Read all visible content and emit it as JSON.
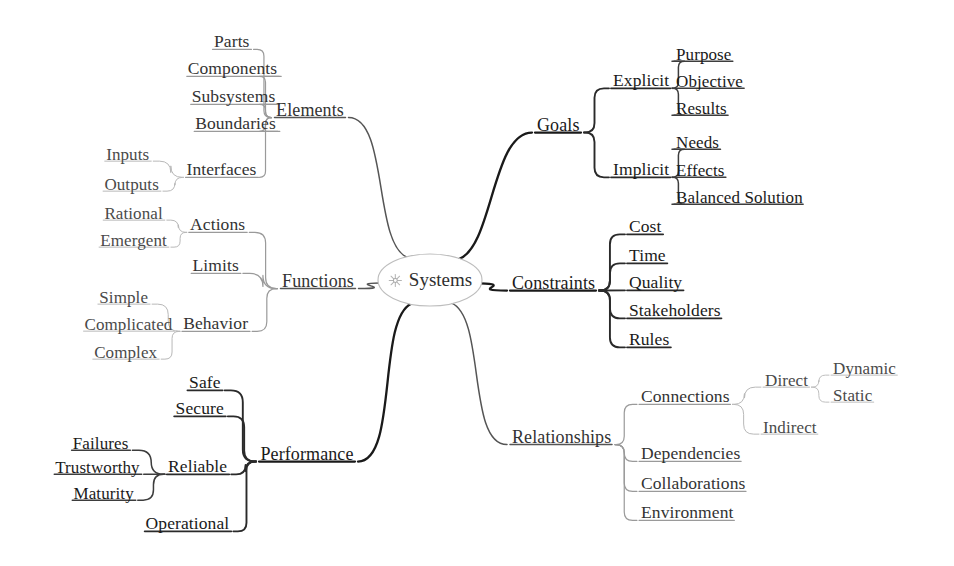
{
  "diagram": {
    "type": "mind-map",
    "title": "Systems",
    "center": {
      "label": "Systems",
      "icon": "starburst-icon",
      "x": 430,
      "y": 280,
      "rx": 52,
      "ry": 26
    },
    "colors": {
      "background": "#ffffff",
      "text": "#2b2b2b",
      "stroke_dark": "#1a1a1a",
      "stroke_mid": "#555555",
      "stroke_light": "#9a9a9a",
      "stroke_faint": "#b8b8b8"
    },
    "branches": [
      {
        "id": "elements",
        "label": "Elements",
        "side": "left",
        "weight": "light",
        "x": 310,
        "y": 110,
        "children": [
          {
            "label": "Parts",
            "x": 232,
            "y": 42,
            "weight": "light",
            "children": []
          },
          {
            "label": "Components",
            "x": 233,
            "y": 69,
            "weight": "light",
            "children": []
          },
          {
            "label": "Subsystems",
            "x": 234,
            "y": 97,
            "weight": "light",
            "children": []
          },
          {
            "label": "Boundaries",
            "x": 236,
            "y": 124,
            "weight": "light",
            "children": []
          },
          {
            "label": "Interfaces",
            "x": 222,
            "y": 170,
            "weight": "light",
            "children": [
              {
                "label": "Inputs",
                "x": 128,
                "y": 154,
                "weight": "light"
              },
              {
                "label": "Outputs",
                "x": 132,
                "y": 184,
                "weight": "light"
              }
            ]
          }
        ]
      },
      {
        "id": "functions",
        "label": "Functions",
        "side": "left",
        "weight": "light",
        "x": 318,
        "y": 281,
        "children": [
          {
            "label": "Actions",
            "x": 218,
            "y": 225,
            "weight": "light",
            "children": [
              {
                "label": "Rational",
                "x": 134,
                "y": 213,
                "weight": "light"
              },
              {
                "label": "Emergent",
                "x": 134,
                "y": 240,
                "weight": "light"
              }
            ]
          },
          {
            "label": "Limits",
            "x": 216,
            "y": 266,
            "weight": "light",
            "children": []
          },
          {
            "label": "Behavior",
            "x": 216,
            "y": 324,
            "weight": "light",
            "children": [
              {
                "label": "Simple",
                "x": 124,
                "y": 297,
                "weight": "light"
              },
              {
                "label": "Complicated",
                "x": 129,
                "y": 324,
                "weight": "light"
              },
              {
                "label": "Complex",
                "x": 126,
                "y": 352,
                "weight": "light"
              }
            ]
          }
        ]
      },
      {
        "id": "performance",
        "label": "Performance",
        "side": "left",
        "weight": "dark",
        "x": 307,
        "y": 454,
        "children": [
          {
            "label": "Safe",
            "x": 205,
            "y": 383,
            "weight": "dark",
            "children": []
          },
          {
            "label": "Secure",
            "x": 200,
            "y": 409,
            "weight": "dark",
            "children": []
          },
          {
            "label": "Reliable",
            "x": 198,
            "y": 467,
            "weight": "dark",
            "children": [
              {
                "label": "Failures",
                "x": 101,
                "y": 443,
                "weight": "dark"
              },
              {
                "label": "Trustworthy",
                "x": 98,
                "y": 467,
                "weight": "dark"
              },
              {
                "label": "Maturity",
                "x": 104,
                "y": 493,
                "weight": "dark"
              }
            ]
          },
          {
            "label": "Operational",
            "x": 188,
            "y": 524,
            "weight": "dark",
            "children": []
          }
        ]
      },
      {
        "id": "goals",
        "label": "Goals",
        "side": "right",
        "weight": "dark",
        "x": 537,
        "y": 125,
        "children": [
          {
            "label": "Explicit",
            "x": 613,
            "y": 81,
            "weight": "dark",
            "children": [
              {
                "label": "Purpose",
                "x": 676,
                "y": 54
              },
              {
                "label": "Objective",
                "x": 676,
                "y": 81
              },
              {
                "label": "Results",
                "x": 676,
                "y": 108
              }
            ]
          },
          {
            "label": "Implicit",
            "x": 613,
            "y": 170,
            "weight": "dark",
            "children": [
              {
                "label": "Needs",
                "x": 676,
                "y": 142
              },
              {
                "label": "Effects",
                "x": 676,
                "y": 170
              },
              {
                "label": "Balanced Solution",
                "x": 676,
                "y": 197
              }
            ]
          }
        ]
      },
      {
        "id": "constraints",
        "label": "Constraints",
        "side": "right",
        "weight": "dark",
        "x": 512,
        "y": 283,
        "children": [
          {
            "label": "Cost",
            "x": 629,
            "y": 227,
            "weight": "dark",
            "children": []
          },
          {
            "label": "Time",
            "x": 629,
            "y": 256,
            "weight": "dark",
            "children": []
          },
          {
            "label": "Quality",
            "x": 629,
            "y": 283,
            "weight": "dark",
            "children": []
          },
          {
            "label": "Stakeholders",
            "x": 629,
            "y": 311,
            "weight": "dark",
            "children": []
          },
          {
            "label": "Rules",
            "x": 629,
            "y": 340,
            "weight": "dark",
            "children": []
          }
        ]
      },
      {
        "id": "relationships",
        "label": "Relationships",
        "side": "right",
        "weight": "light",
        "x": 512,
        "y": 437,
        "children": [
          {
            "label": "Connections",
            "x": 641,
            "y": 397,
            "weight": "light",
            "children": [
              {
                "label": "Direct",
                "x": 765,
                "y": 380,
                "weight": "light",
                "children": [
                  {
                    "label": "Dynamic",
                    "x": 833,
                    "y": 368
                  },
                  {
                    "label": "Static",
                    "x": 833,
                    "y": 395
                  }
                ]
              },
              {
                "label": "Indirect",
                "x": 763,
                "y": 427,
                "weight": "light",
                "children": []
              }
            ]
          },
          {
            "label": "Dependencies",
            "x": 641,
            "y": 454,
            "weight": "light",
            "children": []
          },
          {
            "label": "Collaborations",
            "x": 641,
            "y": 484,
            "weight": "light",
            "children": []
          },
          {
            "label": "Environment",
            "x": 641,
            "y": 513,
            "weight": "light",
            "children": []
          }
        ]
      }
    ]
  }
}
